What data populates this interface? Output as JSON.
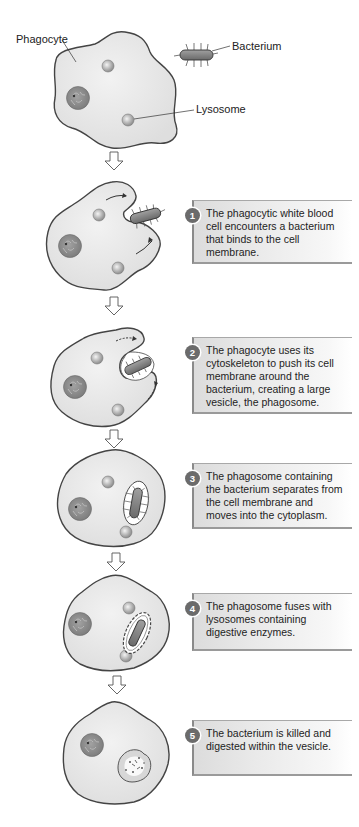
{
  "labels": {
    "phagocyte": "Phagocyte",
    "bacterium": "Bacterium",
    "lysosome": "Lysosome"
  },
  "steps": [
    {
      "number": "1",
      "text": "The phagocytic white blood cell encounters a bacterium that binds to the cell membrane."
    },
    {
      "number": "2",
      "text": "The phagocyte uses its cytoskeleton to push its cell membrane around the bacterium, creating a large vesicle, the phagosome."
    },
    {
      "number": "3",
      "text": "The phagosome containing the bacterium separates from the cell membrane and moves into the cytoplasm."
    },
    {
      "number": "4",
      "text": "The phagosome fuses with lysosomes containing digestive enzymes."
    },
    {
      "number": "5",
      "text": "The bacterium is killed and digested within the vesicle."
    }
  ],
  "colors": {
    "cell_fill": "#e9e9e9",
    "cell_outline": "#4a4a4a",
    "organelle": "#9a9a9a",
    "nucleus": "#8a8a8a",
    "bacterium": "#7d7d7d",
    "badge": "#6b6b6b"
  }
}
